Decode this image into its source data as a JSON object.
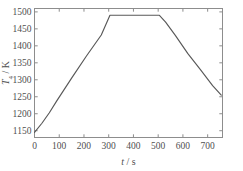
{
  "chart_data": {
    "type": "line",
    "title": "",
    "subtitle": "",
    "xlabel": "t / s",
    "xlabel_symbol": "t",
    "xlabel_unit": "s",
    "ylabel": "T4 / K",
    "ylabel_symbol": "T",
    "ylabel_subscript": "4",
    "ylabel_unit": "K",
    "xlim": [
      0,
      760
    ],
    "ylim": [
      1130,
      1510
    ],
    "grid": false,
    "legend": false,
    "legend_position": "none",
    "x_ticks": [
      0,
      100,
      200,
      300,
      400,
      500,
      600,
      700
    ],
    "x_tick_labels": [
      "0",
      "100",
      "200",
      "300",
      "400",
      "500",
      "600",
      "700"
    ],
    "y_ticks": [
      1150,
      1200,
      1250,
      1300,
      1350,
      1400,
      1450,
      1500
    ],
    "y_tick_labels": [
      "1150",
      "1200",
      "1250",
      "1300",
      "1350",
      "1400",
      "1450",
      "1500"
    ],
    "tick_direction": "in",
    "frame": "box",
    "line_color": "#585858",
    "axis_color": "#8d8d8d",
    "background_color": "#ffffff",
    "series": [
      {
        "name": "T4",
        "x": [
          0,
          30,
          60,
          90,
          150,
          210,
          270,
          305,
          340,
          400,
          460,
          505,
          530,
          570,
          620,
          670,
          720,
          755
        ],
        "y": [
          1145,
          1172,
          1203,
          1238,
          1305,
          1370,
          1432,
          1490,
          1490,
          1490,
          1490,
          1490,
          1470,
          1430,
          1377,
          1331,
          1283,
          1255
        ]
      }
    ]
  }
}
